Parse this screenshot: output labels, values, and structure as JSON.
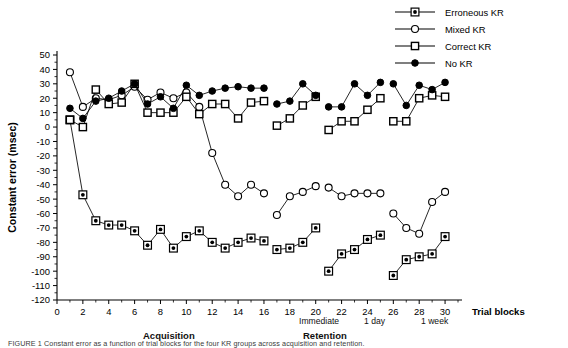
{
  "figure": {
    "ylabel": "Constant error (msec)",
    "xlabel": "Trial blocks",
    "caption": "FIGURE 1  Constant error as a function of trial blocks for the four KR groups across acquisition and retention.",
    "phase_acquisition": "Acquisition",
    "phase_retention": "Retention",
    "retention_sub": [
      "Immediate",
      "1 day",
      "1 week"
    ]
  },
  "legend": {
    "position": "top-right",
    "items": [
      {
        "label": "Erroneous KR",
        "marker": "filled-dot-in-square",
        "color": "#000000"
      },
      {
        "label": "Mixed KR",
        "marker": "open-circle",
        "color": "#000000"
      },
      {
        "label": "Correct KR",
        "marker": "open-square",
        "color": "#000000"
      },
      {
        "label": "No KR",
        "marker": "filled-circle",
        "color": "#000000"
      }
    ]
  },
  "chart_data": {
    "type": "line",
    "title": "",
    "xlabel": "Trial blocks",
    "ylabel": "Constant error (msec)",
    "xlim": [
      0,
      31
    ],
    "ylim": [
      -120,
      50
    ],
    "ytick_step": 10,
    "xtick_step": 2,
    "yticks": [
      50,
      40,
      30,
      20,
      10,
      0,
      -10,
      -20,
      -30,
      -40,
      -50,
      -60,
      -70,
      -80,
      -90,
      -100,
      -110,
      -120
    ],
    "xticks": [
      0,
      2,
      4,
      6,
      8,
      10,
      12,
      14,
      16,
      18,
      20,
      22,
      24,
      26,
      28,
      30
    ],
    "grid": false,
    "legend_position": "top-right",
    "segments": {
      "acquisition": [
        1,
        2,
        3,
        4,
        5,
        6,
        7,
        8,
        9,
        10,
        11,
        12,
        13,
        14,
        15,
        16
      ],
      "immediate": [
        17,
        18,
        19,
        20
      ],
      "one_day": [
        21,
        22,
        23,
        24,
        25
      ],
      "one_week": [
        26,
        27,
        28,
        29,
        30
      ]
    },
    "annotations": [
      {
        "text": "Acquisition",
        "x": 8
      },
      {
        "text": "Retention",
        "x": 23
      },
      {
        "text": "Immediate",
        "x": 18
      },
      {
        "text": "1 day",
        "x": 23
      },
      {
        "text": "1 week",
        "x": 28
      }
    ],
    "series": [
      {
        "name": "Erroneous KR",
        "marker": "filled-dot-in-square",
        "points": [
          {
            "x": 1,
            "y": 5
          },
          {
            "x": 2,
            "y": -47
          },
          {
            "x": 3,
            "y": -65
          },
          {
            "x": 4,
            "y": -68
          },
          {
            "x": 5,
            "y": -68
          },
          {
            "x": 6,
            "y": -72
          },
          {
            "x": 7,
            "y": -82
          },
          {
            "x": 8,
            "y": -71
          },
          {
            "x": 9,
            "y": -84
          },
          {
            "x": 10,
            "y": -76
          },
          {
            "x": 11,
            "y": -72
          },
          {
            "x": 12,
            "y": -80
          },
          {
            "x": 13,
            "y": -84
          },
          {
            "x": 14,
            "y": -80
          },
          {
            "x": 15,
            "y": -77
          },
          {
            "x": 16,
            "y": -79
          },
          {
            "x": 17,
            "y": -85
          },
          {
            "x": 18,
            "y": -84
          },
          {
            "x": 19,
            "y": -80
          },
          {
            "x": 20,
            "y": -70
          },
          {
            "x": 21,
            "y": -100
          },
          {
            "x": 22,
            "y": -88
          },
          {
            "x": 23,
            "y": -85
          },
          {
            "x": 24,
            "y": -78
          },
          {
            "x": 25,
            "y": -75
          },
          {
            "x": 26,
            "y": -103
          },
          {
            "x": 27,
            "y": -92
          },
          {
            "x": 28,
            "y": -90
          },
          {
            "x": 29,
            "y": -88
          },
          {
            "x": 30,
            "y": -76
          }
        ]
      },
      {
        "name": "Mixed KR",
        "marker": "open-circle",
        "points": [
          {
            "x": 1,
            "y": 38
          },
          {
            "x": 2,
            "y": 14
          },
          {
            "x": 3,
            "y": 20
          },
          {
            "x": 4,
            "y": 19
          },
          {
            "x": 5,
            "y": 22
          },
          {
            "x": 6,
            "y": 28
          },
          {
            "x": 7,
            "y": 19
          },
          {
            "x": 8,
            "y": 24
          },
          {
            "x": 9,
            "y": 20
          },
          {
            "x": 10,
            "y": 24
          },
          {
            "x": 11,
            "y": 14
          },
          {
            "x": 12,
            "y": -18
          },
          {
            "x": 13,
            "y": -40
          },
          {
            "x": 14,
            "y": -48
          },
          {
            "x": 15,
            "y": -40
          },
          {
            "x": 16,
            "y": -46
          },
          {
            "x": 17,
            "y": -61
          },
          {
            "x": 18,
            "y": -48
          },
          {
            "x": 19,
            "y": -45
          },
          {
            "x": 20,
            "y": -41
          },
          {
            "x": 21,
            "y": -42
          },
          {
            "x": 22,
            "y": -48
          },
          {
            "x": 23,
            "y": -46
          },
          {
            "x": 24,
            "y": -46
          },
          {
            "x": 25,
            "y": -46
          },
          {
            "x": 26,
            "y": -60
          },
          {
            "x": 27,
            "y": -70
          },
          {
            "x": 28,
            "y": -74
          },
          {
            "x": 29,
            "y": -52
          },
          {
            "x": 30,
            "y": -45
          }
        ]
      },
      {
        "name": "Correct KR",
        "marker": "open-square",
        "points": [
          {
            "x": 1,
            "y": 5
          },
          {
            "x": 2,
            "y": 0
          },
          {
            "x": 3,
            "y": 26
          },
          {
            "x": 4,
            "y": 16
          },
          {
            "x": 5,
            "y": 17
          },
          {
            "x": 6,
            "y": 30
          },
          {
            "x": 7,
            "y": 10
          },
          {
            "x": 8,
            "y": 10
          },
          {
            "x": 9,
            "y": 10
          },
          {
            "x": 10,
            "y": 21
          },
          {
            "x": 11,
            "y": 9
          },
          {
            "x": 12,
            "y": 16
          },
          {
            "x": 13,
            "y": 16
          },
          {
            "x": 14,
            "y": 6
          },
          {
            "x": 15,
            "y": 17
          },
          {
            "x": 16,
            "y": 18
          },
          {
            "x": 17,
            "y": 1
          },
          {
            "x": 18,
            "y": 6
          },
          {
            "x": 19,
            "y": 15
          },
          {
            "x": 20,
            "y": 21
          },
          {
            "x": 21,
            "y": -2
          },
          {
            "x": 22,
            "y": 4
          },
          {
            "x": 23,
            "y": 4
          },
          {
            "x": 24,
            "y": 12
          },
          {
            "x": 25,
            "y": 20
          },
          {
            "x": 26,
            "y": 4
          },
          {
            "x": 27,
            "y": 4
          },
          {
            "x": 28,
            "y": 20
          },
          {
            "x": 29,
            "y": 22
          },
          {
            "x": 30,
            "y": 21
          }
        ]
      },
      {
        "name": "No KR",
        "marker": "filled-circle",
        "points": [
          {
            "x": 1,
            "y": 13
          },
          {
            "x": 2,
            "y": 6
          },
          {
            "x": 3,
            "y": 18
          },
          {
            "x": 4,
            "y": 20
          },
          {
            "x": 5,
            "y": 25
          },
          {
            "x": 6,
            "y": 30
          },
          {
            "x": 7,
            "y": 16
          },
          {
            "x": 8,
            "y": 21
          },
          {
            "x": 9,
            "y": 13
          },
          {
            "x": 10,
            "y": 29
          },
          {
            "x": 11,
            "y": 22
          },
          {
            "x": 12,
            "y": 25
          },
          {
            "x": 13,
            "y": 27
          },
          {
            "x": 14,
            "y": 28
          },
          {
            "x": 15,
            "y": 27
          },
          {
            "x": 16,
            "y": 27
          },
          {
            "x": 17,
            "y": 16
          },
          {
            "x": 18,
            "y": 18
          },
          {
            "x": 19,
            "y": 30
          },
          {
            "x": 20,
            "y": 22
          },
          {
            "x": 21,
            "y": 14
          },
          {
            "x": 22,
            "y": 14
          },
          {
            "x": 23,
            "y": 30
          },
          {
            "x": 24,
            "y": 22
          },
          {
            "x": 25,
            "y": 31
          },
          {
            "x": 26,
            "y": 30
          },
          {
            "x": 27,
            "y": 15
          },
          {
            "x": 28,
            "y": 29
          },
          {
            "x": 29,
            "y": 26
          },
          {
            "x": 30,
            "y": 31
          }
        ]
      }
    ]
  }
}
